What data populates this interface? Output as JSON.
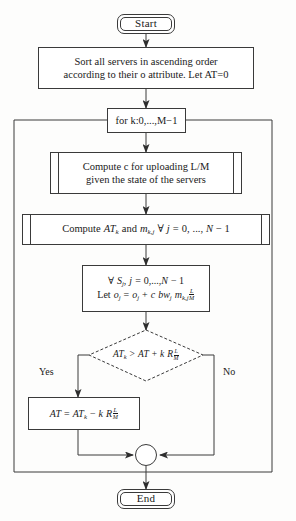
{
  "diagram": {
    "type": "flowchart",
    "stroke_color": "#3a3a3a",
    "background_color": "#fdfdfc",
    "text_color": "#1a1a1a"
  },
  "nodes": {
    "start": {
      "label": "Start",
      "shape": "terminator"
    },
    "sort": {
      "line1": "Sort all servers in ascending order",
      "line2": "according to their o attribute. Let AT=0",
      "shape": "process"
    },
    "loop": {
      "label": "for k:0,...,M−1",
      "shape": "loop-header"
    },
    "compute_c": {
      "line1": "Compute c for uploading L/M",
      "line2": "given the state of the servers",
      "shape": "predefined-process"
    },
    "compute_at": {
      "text": "Compute AT_k and m_{k,j} ∀ j = 0, ..., N − 1",
      "parts": {
        "word_compute": "Compute",
        "at_k": "AT",
        "at_k_sub": "k",
        "and": "and",
        "m": "m",
        "m_sub": "k,j",
        "forall": "∀",
        "j": "j",
        "eq": "=",
        "zero": "0,",
        "dots": "...,",
        "N": "N",
        "minus_one": "− 1"
      },
      "shape": "predefined-process"
    },
    "update_o": {
      "line1": {
        "forall": "∀",
        "S": "S",
        "S_sub": "j",
        "comma": ",",
        "j": "j",
        "eq": "=",
        "zero": "0,",
        "dots": "...,",
        "N": "N",
        "minus_one": "− 1"
      },
      "line2": {
        "let": "Let",
        "o": "o",
        "o_sub": "j",
        "eq": "=",
        "o2": "o",
        "o2_sub": "j",
        "plus": "+",
        "c": "c",
        "bw": "bw",
        "bw_sub": "j",
        "m": "m",
        "m_sub": "k,j",
        "frac_num": "L",
        "frac_den": "M"
      },
      "shape": "process"
    },
    "decision": {
      "text": "AT_k > AT + k R L/M",
      "parts": {
        "at_k": "AT",
        "at_k_sub": "k",
        "gt": ">",
        "at": "AT",
        "plus": "+",
        "k": "k",
        "R": "R",
        "frac_num": "L",
        "frac_den": "M"
      },
      "shape": "decision"
    },
    "assign_at": {
      "text": "AT = AT_k − k R L/M",
      "parts": {
        "at": "AT",
        "eq": "=",
        "at_k": "AT",
        "at_k_sub": "k",
        "minus": "−",
        "k": "k",
        "R": "R",
        "frac_num": "L",
        "frac_den": "M"
      },
      "shape": "process"
    },
    "merge": {
      "label": "",
      "shape": "connector-circle"
    },
    "end": {
      "label": "End",
      "shape": "terminator"
    }
  },
  "edge_labels": {
    "yes": "Yes",
    "no": "No"
  }
}
